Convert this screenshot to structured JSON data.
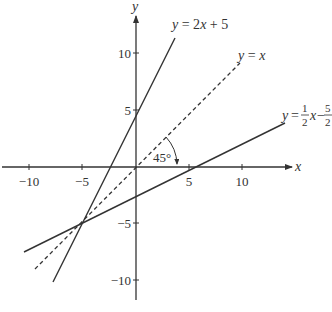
{
  "axes": {
    "x_label": "x",
    "y_label": "y",
    "x_ticks": [
      {
        "value": -10,
        "label": "−10"
      },
      {
        "value": -5,
        "label": "−5"
      },
      {
        "value": 5,
        "label": "5"
      },
      {
        "value": 10,
        "label": "10"
      }
    ],
    "y_ticks": [
      {
        "value": 10,
        "label": "10"
      },
      {
        "value": 5,
        "label": "5"
      },
      {
        "value": -5,
        "label": "−5"
      },
      {
        "value": -10,
        "label": "−10"
      }
    ]
  },
  "lines": [
    {
      "id": "line-2x-plus-5",
      "equation": "y = 2x + 5",
      "style": "solid"
    },
    {
      "id": "line-y-equals-x",
      "equation": "y = x",
      "style": "dashed"
    },
    {
      "id": "line-half-x-minus-five-halves",
      "equation": "y = 1/2 x − 5/2",
      "style": "solid",
      "label_parts": {
        "y": "y",
        "eq": "=",
        "num1": "1",
        "den1": "2",
        "x": "x",
        "minus": "−",
        "num2": "5",
        "den2": "2"
      }
    }
  ],
  "label_2x5": {
    "y": "y",
    "rest": " = 2",
    "x": "x",
    "tail": " + 5"
  },
  "label_yx": {
    "y": "y",
    "eq": " = ",
    "x": "x"
  },
  "angle": {
    "label": "45°"
  },
  "intersection": {
    "x": -5,
    "y": -5
  },
  "colors": {
    "ink": "#333333",
    "background": "#ffffff"
  }
}
